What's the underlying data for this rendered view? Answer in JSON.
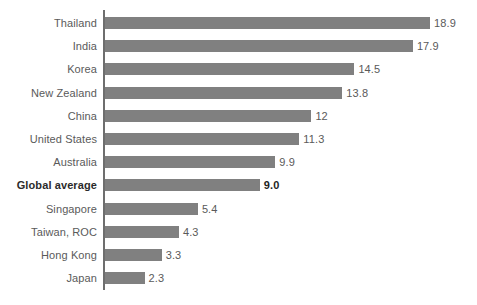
{
  "chart_data": {
    "type": "bar",
    "orientation": "horizontal",
    "title": "",
    "subtitle": "",
    "xlabel": "",
    "ylabel": "",
    "grid": false,
    "legend": false,
    "xlim": [
      0,
      18.9
    ],
    "categories": [
      "Thailand",
      "India",
      "Korea",
      "New Zealand",
      "China",
      "United States",
      "Australia",
      "Global average",
      "Singapore",
      "Taiwan, ROC",
      "Hong Kong",
      "Japan"
    ],
    "values": [
      18.9,
      17.9,
      14.5,
      13.8,
      12,
      11.3,
      9.9,
      9.0,
      5.4,
      4.3,
      3.3,
      2.3
    ],
    "value_labels": [
      "18.9",
      "17.9",
      "14.5",
      "13.8",
      "12",
      "11.3",
      "9.9",
      "9.0",
      "5.4",
      "4.3",
      "3.3",
      "2.3"
    ],
    "highlight_category": "Global average",
    "bar_color": "#808080",
    "axis_color": "#6e6e6e",
    "label_color": "#5a5a5a",
    "highlight_label_color": "#1f1f1f",
    "background_color": "#ffffff"
  },
  "rows": [
    {
      "label": "Thailand",
      "value": 18.9,
      "value_label": "18.9",
      "bold": false
    },
    {
      "label": "India",
      "value": 17.9,
      "value_label": "17.9",
      "bold": false
    },
    {
      "label": "Korea",
      "value": 14.5,
      "value_label": "14.5",
      "bold": false
    },
    {
      "label": "New Zealand",
      "value": 13.8,
      "value_label": "13.8",
      "bold": false
    },
    {
      "label": "China",
      "value": 12,
      "value_label": "12",
      "bold": false
    },
    {
      "label": "United States",
      "value": 11.3,
      "value_label": "11.3",
      "bold": false
    },
    {
      "label": "Australia",
      "value": 9.9,
      "value_label": "9.9",
      "bold": false
    },
    {
      "label": "Global average",
      "value": 9.0,
      "value_label": "9.0",
      "bold": true
    },
    {
      "label": "Singapore",
      "value": 5.4,
      "value_label": "5.4",
      "bold": false
    },
    {
      "label": "Taiwan, ROC",
      "value": 4.3,
      "value_label": "4.3",
      "bold": false
    },
    {
      "label": "Hong Kong",
      "value": 3.3,
      "value_label": "3.3",
      "bold": false
    },
    {
      "label": "Japan",
      "value": 2.3,
      "value_label": "2.3",
      "bold": false
    }
  ],
  "scale": {
    "px_per_unit": 17.2,
    "bar_origin_x": 105
  }
}
